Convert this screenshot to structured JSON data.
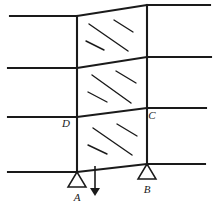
{
  "figure": {
    "background_color": "#ffffff",
    "line_color": "#1a1a1a",
    "hatch_color": "#1a1a1a",
    "label_color": "#1a1a1a",
    "width": 213,
    "height": 205
  },
  "labels": {
    "point_a": "A",
    "point_b": "B",
    "point_c": "C",
    "point_d": "D"
  },
  "label_positions": {
    "point_a": {
      "x": 77,
      "y": 201
    },
    "point_b": {
      "x": 147,
      "y": 193
    },
    "point_c": {
      "x": 152,
      "y": 119
    },
    "point_d": {
      "x": 66,
      "y": 127
    }
  },
  "columns": [
    {
      "name": "left-column",
      "x": 77,
      "y_top": 16,
      "y_bottom": 172
    },
    {
      "name": "right-column",
      "x": 147,
      "y_top": 5,
      "y_bottom": 165
    }
  ],
  "floor_lines": [
    {
      "name": "roof-line",
      "left_x": 10,
      "left_y": 16,
      "bay_left_x": 77,
      "bay_left_y": 16,
      "bay_right_x": 147,
      "bay_right_y": 5,
      "right_x": 210,
      "right_y": 5
    },
    {
      "name": "third-floor-line",
      "left_x": 8,
      "left_y": 68,
      "bay_left_x": 77,
      "bay_left_y": 68,
      "bay_right_x": 147,
      "bay_right_y": 57,
      "right_x": 211,
      "right_y": 57
    },
    {
      "name": "second-floor-line",
      "left_x": 8,
      "left_y": 117,
      "bay_left_x": 77,
      "bay_left_y": 117,
      "bay_right_x": 147,
      "bay_right_y": 108,
      "right_x": 206,
      "right_y": 108
    },
    {
      "name": "ground-line",
      "left_x": 8,
      "left_y": 172,
      "bay_left_x": 77,
      "bay_left_y": 172,
      "bay_right_x": 147,
      "bay_right_y": 164,
      "right_x": 205,
      "right_y": 164
    }
  ],
  "panels": [
    {
      "name": "upper-shear-panel",
      "hatches": [
        {
          "x1": 89,
          "y1": 24,
          "x2": 128,
          "y2": 51
        },
        {
          "x1": 114,
          "y1": 20,
          "x2": 133,
          "y2": 32
        },
        {
          "x1": 86,
          "y1": 41,
          "x2": 104,
          "y2": 50
        }
      ]
    },
    {
      "name": "middle-shear-panel",
      "hatches": [
        {
          "x1": 92,
          "y1": 75,
          "x2": 131,
          "y2": 103
        },
        {
          "x1": 116,
          "y1": 71,
          "x2": 136,
          "y2": 83
        },
        {
          "x1": 88,
          "y1": 92,
          "x2": 107,
          "y2": 102
        }
      ]
    },
    {
      "name": "lower-shear-panel",
      "hatches": [
        {
          "x1": 93,
          "y1": 128,
          "x2": 132,
          "y2": 155
        },
        {
          "x1": 117,
          "y1": 124,
          "x2": 137,
          "y2": 136
        },
        {
          "x1": 88,
          "y1": 145,
          "x2": 107,
          "y2": 154
        }
      ]
    }
  ],
  "supports": [
    {
      "name": "support-a",
      "apex_x": 77,
      "apex_y": 172,
      "half_width": 9,
      "height": 15
    },
    {
      "name": "support-b",
      "apex_x": 147,
      "apex_y": 164,
      "half_width": 9,
      "height": 15
    }
  ],
  "load_arrow": {
    "name": "point-load-arrow",
    "x": 95,
    "y_start": 166,
    "y_end": 196,
    "head_width": 5,
    "head_length": 8
  }
}
